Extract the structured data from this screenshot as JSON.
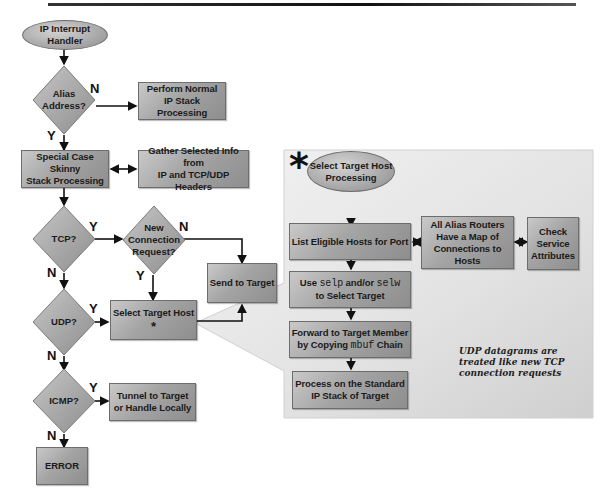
{
  "diagram": {
    "title_rule": true,
    "nodes": {
      "start": "IP Interrupt Handler",
      "alias_q": "Alias Address?",
      "normal": "Perform Normal IP Stack Processing",
      "normal_l1": "Perform Normal",
      "normal_l2": "IP Stack Processing",
      "skinny_l1": "Special Case Skinny",
      "skinny_l2": "Stack Processing",
      "gather_l1": "Gather Selected Info from",
      "gather_l2": "IP and TCP/UDP Headers",
      "tcp_q": "TCP?",
      "newconn_l1": "New",
      "newconn_l2": "Connection",
      "newconn_l3": "Request?",
      "send": "Send to Target",
      "udp_q": "UDP?",
      "select": "Select Target Host",
      "select_mark": "*",
      "icmp_q": "ICMP?",
      "tunnel_l1": "Tunnel to Target",
      "tunnel_l2": "or Handle Locally",
      "error": "ERROR"
    },
    "labels": {
      "alias_no": "N",
      "alias_yes": "Y",
      "tcp_yes": "Y",
      "tcp_no": "N",
      "newconn_no": "N",
      "newconn_yes": "Y",
      "udp_yes": "Y",
      "udp_no": "N",
      "icmp_yes": "Y",
      "icmp_no": "N"
    },
    "detail_panel": {
      "marker": "*",
      "start_l1": "Select Target Host",
      "start_l2": "Processing",
      "list": "List Eligible Hosts for Port",
      "use_prefix": "Use ",
      "use_code1": "selp",
      "use_mid": " and/or ",
      "use_code2": "selw",
      "use_l2": "to Select Target",
      "forward_l1": "Forward to Target Member",
      "forward_prefix": "by Copying ",
      "forward_code": "mbuf",
      "forward_suffix": " Chain",
      "process_l1": "Process on the Standard",
      "process_l2": "IP Stack of Target",
      "routers_l1": "All Alias Routers",
      "routers_l2": "Have a Map of",
      "routers_l3": "Connections to Hosts",
      "check_l1": "Check",
      "check_l2": "Service",
      "check_l3": "Attributes",
      "note_l1": "UDP datagrams are",
      "note_l2": "treated like new TCP",
      "note_l3": "connection requests"
    },
    "colors": {
      "box_fill": "#a4a4a4",
      "panel_fill": "#e6e6e6",
      "line": "#111111"
    }
  }
}
